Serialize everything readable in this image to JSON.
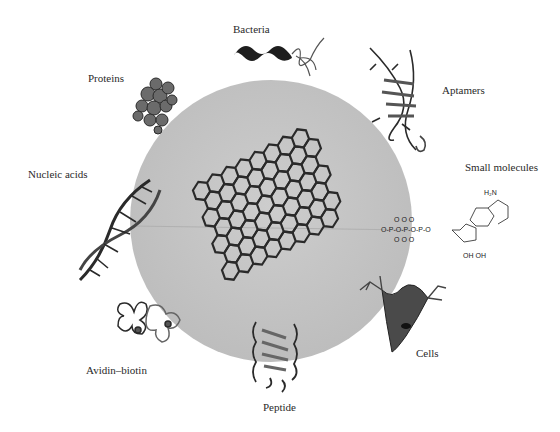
{
  "diagram": {
    "center_label": "graphene",
    "colors": {
      "disk": "#c4c4c4",
      "ink": "#222222",
      "background": "#ffffff"
    },
    "labels": {
      "bacteria": "Bacteria",
      "proteins": "Proteins",
      "aptamers": "Aptamers",
      "nucleic_acids": "Nucleic acids",
      "small_molecules": "Small molecules",
      "avidin_biotin": "Avidin–biotin",
      "cells": "Cells",
      "peptide": "Peptide"
    },
    "molecule_text": {
      "amine": "H₂N",
      "hydroxyls": "OH OH"
    }
  }
}
